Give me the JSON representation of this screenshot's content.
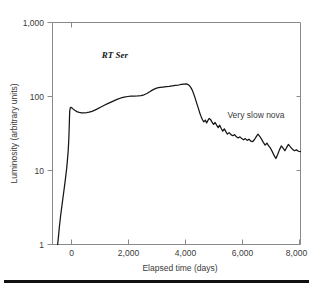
{
  "chart_data": {
    "type": "line",
    "title": "",
    "subtitle": "",
    "xlabel": "Elapsed time (days)",
    "ylabel": "Luminosity (arbitrary units)",
    "xlim": [
      -670,
      9000
    ],
    "ylim": [
      1,
      1000
    ],
    "yscale": "log",
    "xscale": "linear",
    "grid": false,
    "legend_position": "none",
    "xticks": [
      0,
      2000,
      4000,
      6000,
      8000
    ],
    "xtick_labels": [
      "0",
      "2,000",
      "4,000",
      "6,000",
      "8,000"
    ],
    "yticks": [
      1,
      10,
      100,
      1000
    ],
    "ytick_labels": [
      "1",
      "10",
      "100",
      "1,000"
    ],
    "annotations": [
      {
        "text": "RT Ser",
        "x": 1250,
        "y": 330,
        "style": "serif-italic"
      },
      {
        "text": "Very slow nova",
        "x": 6150,
        "y": 52,
        "style": "sans"
      }
    ],
    "series": [
      {
        "name": "RT Ser",
        "color": "#16161a",
        "x": [
          -470,
          -440,
          -400,
          -350,
          -300,
          -250,
          -200,
          -160,
          -120,
          -90,
          -60,
          -35,
          -15,
          0,
          20,
          50,
          90,
          140,
          200,
          280,
          370,
          460,
          560,
          660,
          760,
          870,
          980,
          1100,
          1220,
          1350,
          1480,
          1610,
          1740,
          1870,
          2000,
          2130,
          2260,
          2390,
          2520,
          2650,
          2780,
          2900,
          3010,
          3120,
          3220,
          3320,
          3420,
          3520,
          3640,
          3760,
          3880,
          4000,
          4120,
          4240,
          4360,
          4460,
          4540,
          4600,
          4660,
          4720,
          4780,
          4830,
          4880,
          4930,
          4980,
          5030,
          5080,
          5130,
          5180,
          5230,
          5290,
          5340,
          5390,
          5440,
          5490,
          5550,
          5610,
          5670,
          5730,
          5790,
          5850,
          5910,
          5970,
          6030,
          6090,
          6150,
          6220,
          6290,
          6360,
          6430,
          6500,
          6570,
          6640,
          6710,
          6780,
          6850,
          6920,
          6990,
          7060,
          7130,
          7200,
          7270,
          7340,
          7410,
          7480,
          7550,
          7620,
          7690,
          7760,
          7830,
          7900,
          7970,
          8040,
          8110,
          8180,
          8250,
          8320,
          8390,
          8460,
          8530,
          8600,
          8680,
          8760,
          8840,
          8920,
          9000
        ],
        "y": [
          1.0,
          1.25,
          1.75,
          2.5,
          3.4,
          4.6,
          6.2,
          8.0,
          10.5,
          13.5,
          18.0,
          26.0,
          42.0,
          62.0,
          70.0,
          71.5,
          70.0,
          67.5,
          65.0,
          62.5,
          61.0,
          60.3,
          60.0,
          60.5,
          61.5,
          63.0,
          65.5,
          68.5,
          72.0,
          76.0,
          80.0,
          84.0,
          88.0,
          92.0,
          95.5,
          98.0,
          100.0,
          101.0,
          101.5,
          102.0,
          103.0,
          105.5,
          110.0,
          116.0,
          122.0,
          127.0,
          130.5,
          132.5,
          134.0,
          135.5,
          137.0,
          139.0,
          141.0,
          143.0,
          145.5,
          147.5,
          148.0,
          146.0,
          141.0,
          133.0,
          122.0,
          110.0,
          98.0,
          86.0,
          76.0,
          67.0,
          59.0,
          53.0,
          48.5,
          45.5,
          48.0,
          44.0,
          47.5,
          50.5,
          49.0,
          45.0,
          42.0,
          44.5,
          41.0,
          38.0,
          41.0,
          37.0,
          34.0,
          36.5,
          33.5,
          31.0,
          32.5,
          30.5,
          29.5,
          30.5,
          28.5,
          27.5,
          28.5,
          27.0,
          26.0,
          27.0,
          25.5,
          26.5,
          25.0,
          24.5,
          26.0,
          28.5,
          31.0,
          29.0,
          26.5,
          24.0,
          22.0,
          23.5,
          21.5,
          20.0,
          18.0,
          16.0,
          14.5,
          16.5,
          19.0,
          21.5,
          20.0,
          18.5,
          20.5,
          22.5,
          21.0,
          19.5,
          18.5,
          19.0,
          18.2,
          18.0
        ]
      }
    ]
  },
  "figure": {
    "footer_rule": "horizontal-rule"
  }
}
